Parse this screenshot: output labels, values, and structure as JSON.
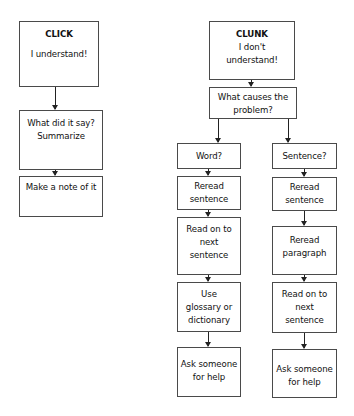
{
  "click_flow": {
    "start": {
      "title": "CLICK",
      "text": "I understand!"
    },
    "steps": [
      {
        "text": "What did it say?",
        "text2": "Summarize"
      },
      {
        "text": "Make a note of it"
      }
    ]
  },
  "clunk_flow": {
    "start": {
      "title": "CLUNK",
      "line1": "I don't",
      "line2": "understand!"
    },
    "question": {
      "line1": "What causes the",
      "line2": "problem?"
    },
    "word_branch": {
      "label": "Word?",
      "steps": [
        {
          "line1": "Reread",
          "line2": "sentence"
        },
        {
          "line1": "Read on to",
          "line2": "next",
          "line3": "sentence"
        },
        {
          "line1": "Use",
          "line2": "glossary or",
          "line3": "dictionary"
        },
        {
          "line1": "Ask someone",
          "line2": "for help"
        }
      ]
    },
    "sentence_branch": {
      "label": "Sentence?",
      "steps": [
        {
          "line1": "Reread",
          "line2": "sentence"
        },
        {
          "line1": "Reread",
          "line2": "paragraph"
        },
        {
          "line1": "Read on to",
          "line2": "next",
          "line3": "sentence"
        },
        {
          "line1": "Ask someone",
          "line2": "for help"
        }
      ]
    }
  }
}
